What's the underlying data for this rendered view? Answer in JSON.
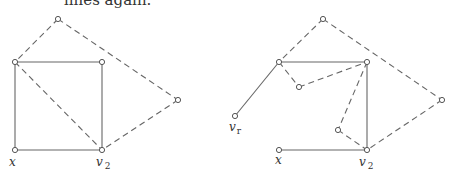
{
  "caption": "lines again.",
  "left_graph": {
    "nodes": [
      {
        "id": "top",
        "x": 58,
        "y": 19,
        "label": ""
      },
      {
        "id": "tl",
        "x": 15,
        "y": 62,
        "label": ""
      },
      {
        "id": "tr",
        "x": 102,
        "y": 62,
        "label": ""
      },
      {
        "id": "far",
        "x": 178,
        "y": 100,
        "label": ""
      },
      {
        "id": "x",
        "x": 15,
        "y": 150,
        "label": "x"
      },
      {
        "id": "v2",
        "x": 102,
        "y": 150,
        "label": "v",
        "sub": "2"
      }
    ],
    "solid_edges": [
      [
        "tl",
        "tr"
      ],
      [
        "tl",
        "x"
      ],
      [
        "tr",
        "v2"
      ],
      [
        "x",
        "v2"
      ]
    ],
    "dashed_edges": [
      [
        "top",
        "tl"
      ],
      [
        "top",
        "far"
      ],
      [
        "tl",
        "v2"
      ],
      [
        "far",
        "v2"
      ]
    ]
  },
  "right_graph": {
    "nodes": [
      {
        "id": "top",
        "x": 323,
        "y": 19,
        "label": ""
      },
      {
        "id": "a",
        "x": 279,
        "y": 62,
        "label": ""
      },
      {
        "id": "b",
        "x": 367,
        "y": 62,
        "label": ""
      },
      {
        "id": "vr",
        "x": 235,
        "y": 116,
        "label": "v",
        "sub": "r"
      },
      {
        "id": "c",
        "x": 299,
        "y": 87,
        "label": ""
      },
      {
        "id": "d",
        "x": 338,
        "y": 130,
        "label": ""
      },
      {
        "id": "far",
        "x": 442,
        "y": 100,
        "label": ""
      },
      {
        "id": "x",
        "x": 279,
        "y": 150,
        "label": "x"
      },
      {
        "id": "v2",
        "x": 367,
        "y": 150,
        "label": "v",
        "sub": "2"
      }
    ],
    "solid_edges": [
      [
        "a",
        "b"
      ],
      [
        "a",
        "vr"
      ],
      [
        "b",
        "v2"
      ],
      [
        "x",
        "v2"
      ]
    ],
    "dashed_edges": [
      [
        "top",
        "a"
      ],
      [
        "top",
        "far"
      ],
      [
        "a",
        "c"
      ],
      [
        "c",
        "b"
      ],
      [
        "b",
        "d"
      ],
      [
        "d",
        "v2"
      ],
      [
        "far",
        "v2"
      ]
    ]
  },
  "labels": {
    "left_x": "x",
    "left_v": "v",
    "left_v_sub": "2",
    "right_vr": "v",
    "right_vr_sub": "r",
    "right_x": "x",
    "right_v": "v",
    "right_v_sub": "2"
  }
}
